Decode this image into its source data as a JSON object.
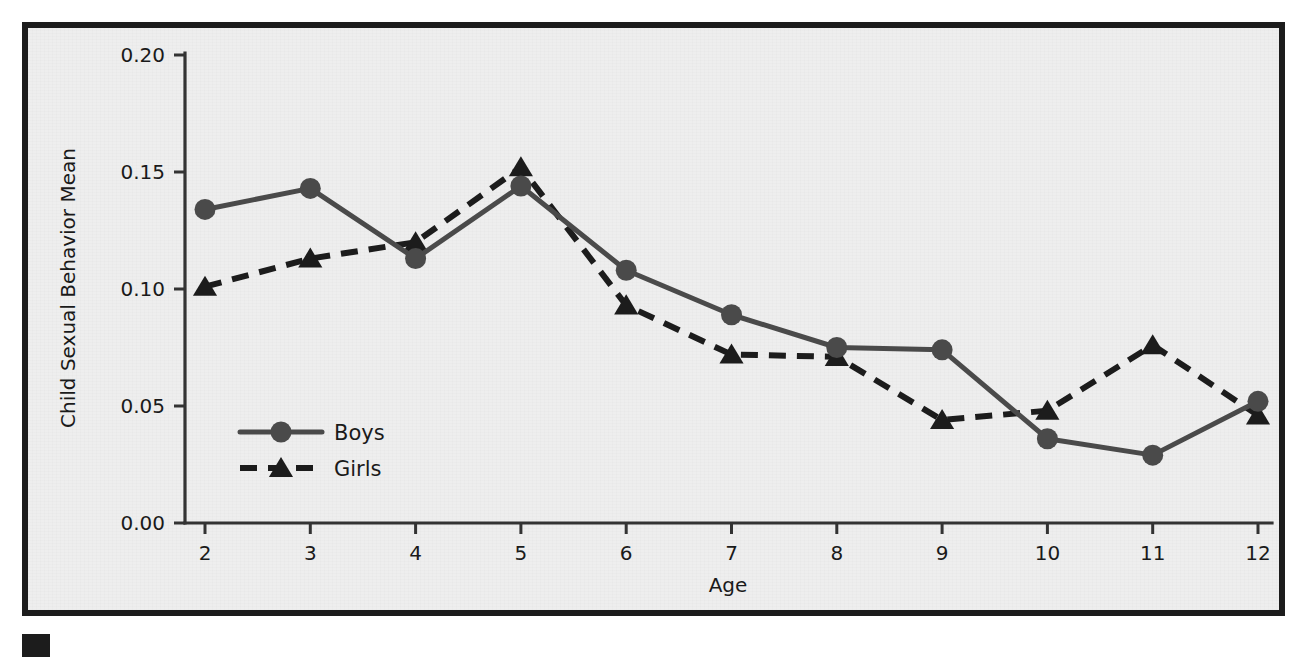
{
  "chart_data": {
    "type": "line",
    "title": "",
    "xlabel": "Age",
    "ylabel": "Child Sexual Behavior Mean",
    "x": [
      2,
      3,
      4,
      5,
      6,
      7,
      8,
      9,
      10,
      11,
      12
    ],
    "xtick_labels": [
      "2",
      "3",
      "4",
      "5",
      "6",
      "7",
      "8",
      "9",
      "10",
      "11",
      "12"
    ],
    "ytick_labels": [
      "0.00",
      "0.05",
      "0.10",
      "0.15",
      "0.20"
    ],
    "ytick_values": [
      0.0,
      0.05,
      0.1,
      0.15,
      0.2
    ],
    "xlim": [
      2,
      12
    ],
    "ylim": [
      0.0,
      0.2
    ],
    "grid": false,
    "legend_position": "inside-lower-left",
    "series": [
      {
        "name": "Boys",
        "style": "solid",
        "marker": "circle",
        "color": "#4a4a4a",
        "values": [
          0.134,
          0.143,
          0.113,
          0.144,
          0.108,
          0.089,
          0.075,
          0.074,
          0.036,
          0.029,
          0.052
        ]
      },
      {
        "name": "Girls",
        "style": "dashed",
        "marker": "triangle",
        "color": "#1c1c1c",
        "values": [
          0.101,
          0.113,
          0.12,
          0.152,
          0.093,
          0.072,
          0.071,
          0.044,
          0.048,
          0.076,
          0.046
        ]
      }
    ]
  },
  "legend": {
    "items": [
      {
        "label": "Boys"
      },
      {
        "label": "Girls"
      }
    ]
  },
  "axes": {
    "x_title": "Age",
    "y_title": "Child Sexual Behavior Mean"
  },
  "colors": {
    "frame": "#1c1c1c",
    "panel_background": "#eeeeee",
    "boys_series": "#4a4a4a",
    "girls_series": "#1c1c1c",
    "axis": "#333333"
  }
}
